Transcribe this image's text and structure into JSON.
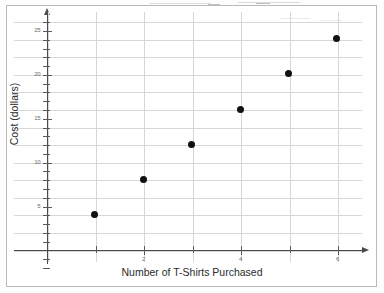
{
  "chart_data": {
    "type": "scatter",
    "title": "",
    "xlabel": "Number of T-Shirts Purchased",
    "ylabel": "Cost (dollars)",
    "x": [
      1,
      2,
      3,
      4,
      5,
      6
    ],
    "values": [
      4,
      8,
      12,
      16,
      20,
      24
    ],
    "points": [
      {
        "x": 1,
        "y": 4
      },
      {
        "x": 2,
        "y": 8
      },
      {
        "x": 3,
        "y": 12
      },
      {
        "x": 4,
        "y": 16
      },
      {
        "x": 5,
        "y": 20
      },
      {
        "x": 6,
        "y": 24
      }
    ],
    "xlim": [
      0,
      7
    ],
    "ylim": [
      0,
      26
    ],
    "x_tick_labels": [
      "2",
      "4",
      "6"
    ],
    "x_tick_values": [
      2,
      4,
      6
    ],
    "x_tick_step": 1,
    "y_tick_labels": [
      "5",
      "10",
      "15",
      "20",
      "25"
    ],
    "y_tick_values": [
      5,
      10,
      15,
      20,
      25
    ],
    "y_tick_step": 1,
    "grid": true,
    "grid_x_step": 1,
    "grid_y_step": 2,
    "legend": false,
    "legend_position": "none",
    "marker": "filled-circle",
    "marker_color": "#111111",
    "grid_color": "#d7d7d7",
    "axis_color": "#4a4a4a",
    "axis_arrows": [
      "up",
      "right"
    ]
  }
}
